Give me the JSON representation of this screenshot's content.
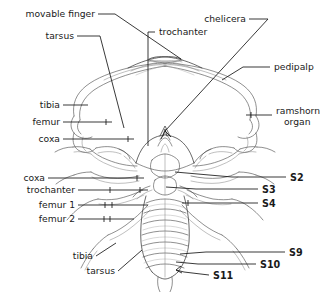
{
  "figure": {
    "view": "ventral",
    "background_color": "#ffffff",
    "ink_color": "#1a1a1a"
  },
  "labels": {
    "movable_finger": "movable finger",
    "tarsus_top": "tarsus",
    "trochanter_top": "trochanter",
    "chelicera": "chelicera",
    "pedipalp": "pedipalp",
    "ramshorn_organ_line1": "ramshorn",
    "ramshorn_organ_line2": "organ",
    "tibia_upper": "tibia",
    "femur_upper": "femur",
    "coxa_upper": "coxa",
    "coxa_lower": "coxa",
    "trochanter_lower": "trochanter",
    "femur_1": "femur 1",
    "femur_2": "femur 2",
    "tibia_lower": "tibia",
    "tarsus_lower": "tarsus"
  },
  "segments": {
    "s2": "S2",
    "s3": "S3",
    "s4": "S4",
    "s9": "S9",
    "s10": "S10",
    "s11": "S11"
  }
}
